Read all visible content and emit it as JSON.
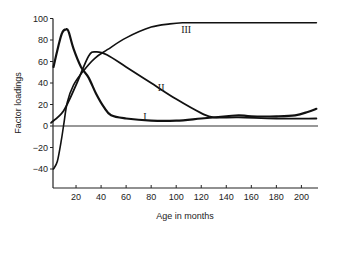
{
  "chart_data": {
    "type": "line",
    "title": "",
    "xlabel": "Age in months",
    "ylabel": "Factor loadings",
    "xlim": [
      0,
      213
    ],
    "ylim": [
      -55,
      100
    ],
    "x_ticks": [
      20,
      40,
      60,
      80,
      100,
      120,
      140,
      160,
      180,
      200
    ],
    "y_ticks": [
      100,
      80,
      60,
      40,
      20,
      0,
      -20,
      -40
    ],
    "grid": false,
    "legend": "none (curves labelled inline)",
    "zero_line": true,
    "series": [
      {
        "name": "I",
        "x": [
          2,
          6,
          9,
          12,
          14,
          18,
          24,
          30,
          36,
          42,
          48,
          60,
          80,
          100,
          120,
          140,
          150,
          160,
          180,
          195,
          205,
          212
        ],
        "values": [
          55,
          75,
          87,
          90,
          88,
          72,
          55,
          45,
          30,
          18,
          10,
          7,
          5,
          5,
          7,
          9,
          10,
          9,
          9,
          10,
          13,
          16
        ],
        "label_position": {
          "x": 75,
          "y": 9
        }
      },
      {
        "name": "II",
        "x": [
          0,
          10,
          20,
          30,
          36,
          45,
          60,
          80,
          100,
          120,
          130,
          150,
          180,
          212
        ],
        "values": [
          3,
          14,
          38,
          65,
          69,
          66,
          55,
          40,
          25,
          12,
          8,
          8,
          7,
          7
        ],
        "label_position": {
          "x": 88,
          "y": 36
        }
      },
      {
        "name": "III",
        "x": [
          2,
          5,
          8,
          10,
          13,
          18,
          25,
          35,
          45,
          60,
          80,
          95,
          105,
          120,
          212
        ],
        "values": [
          -40,
          -33,
          -15,
          0,
          22,
          38,
          50,
          63,
          71,
          82,
          92,
          95,
          96,
          96,
          96
        ],
        "label_position": {
          "x": 108,
          "y": 90
        }
      }
    ]
  }
}
